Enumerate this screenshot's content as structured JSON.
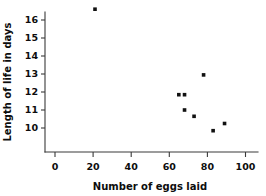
{
  "chart_data": {
    "type": "scatter",
    "title": "",
    "xlabel": "Number of eggs laid",
    "ylabel": "Length of life in days",
    "xlim": [
      0,
      110
    ],
    "ylim": [
      9.2,
      16.9
    ],
    "xticks": [
      0,
      20,
      40,
      60,
      80,
      100
    ],
    "xtick_labels": [
      "0",
      "20",
      "40",
      "60",
      "80",
      "100"
    ],
    "yticks": [
      10,
      11,
      12,
      13,
      14,
      15,
      16
    ],
    "ytick_labels": [
      "10",
      "11",
      "12",
      "13",
      "14",
      "15",
      "16"
    ],
    "grid": false,
    "legend": false,
    "marker": "square",
    "marker_color": "#111111",
    "points": [
      {
        "x": 21,
        "y": 16.6
      },
      {
        "x": 65,
        "y": 11.85
      },
      {
        "x": 68,
        "y": 11.85
      },
      {
        "x": 68,
        "y": 11.0
      },
      {
        "x": 73,
        "y": 10.65
      },
      {
        "x": 78,
        "y": 12.95
      },
      {
        "x": 83,
        "y": 9.85
      },
      {
        "x": 89,
        "y": 10.25
      }
    ]
  },
  "axes": {
    "x_axis_name": "Number of eggs laid",
    "y_axis_name": "Length of life in days"
  }
}
